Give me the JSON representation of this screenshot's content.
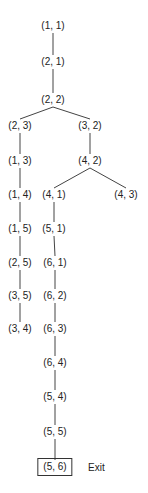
{
  "diagram": {
    "title": "",
    "nodes": [
      {
        "id": "n11",
        "label": "(1, 1)",
        "x": 53,
        "y": 26
      },
      {
        "id": "n21",
        "label": "(2, 1)",
        "x": 53,
        "y": 62
      },
      {
        "id": "n22",
        "label": "(2, 2)",
        "x": 53,
        "y": 100
      },
      {
        "id": "n23",
        "label": "(2, 3)",
        "x": 20,
        "y": 126
      },
      {
        "id": "n32",
        "label": "(3, 2)",
        "x": 90,
        "y": 126
      },
      {
        "id": "n13",
        "label": "(1, 3)",
        "x": 20,
        "y": 161
      },
      {
        "id": "n42",
        "label": "(4, 2)",
        "x": 90,
        "y": 161
      },
      {
        "id": "n14",
        "label": "(1, 4)",
        "x": 20,
        "y": 195
      },
      {
        "id": "n41",
        "label": "(4, 1)",
        "x": 54,
        "y": 195
      },
      {
        "id": "n43",
        "label": "(4, 3)",
        "x": 126,
        "y": 195
      },
      {
        "id": "n15",
        "label": "(1, 5)",
        "x": 20,
        "y": 229
      },
      {
        "id": "n51",
        "label": "(5, 1)",
        "x": 54,
        "y": 229
      },
      {
        "id": "n25",
        "label": "(2, 5)",
        "x": 20,
        "y": 263
      },
      {
        "id": "n61",
        "label": "(6, 1)",
        "x": 55,
        "y": 263
      },
      {
        "id": "n35",
        "label": "(3, 5)",
        "x": 20,
        "y": 296
      },
      {
        "id": "n62",
        "label": "(6, 2)",
        "x": 55,
        "y": 296
      },
      {
        "id": "n34",
        "label": "(3, 4)",
        "x": 20,
        "y": 329
      },
      {
        "id": "n63",
        "label": "(6, 3)",
        "x": 55,
        "y": 329
      },
      {
        "id": "n64",
        "label": "(6, 4)",
        "x": 55,
        "y": 363
      },
      {
        "id": "n54",
        "label": "(5, 4)",
        "x": 55,
        "y": 397
      },
      {
        "id": "n55",
        "label": "(5, 5)",
        "x": 55,
        "y": 432
      },
      {
        "id": "n56",
        "label": "(5, 6)",
        "x": 55,
        "y": 467,
        "boxed": true
      }
    ],
    "edges": [
      [
        "n11",
        "n21"
      ],
      [
        "n21",
        "n22"
      ],
      [
        "n22",
        "n23"
      ],
      [
        "n22",
        "n32"
      ],
      [
        "n23",
        "n13"
      ],
      [
        "n13",
        "n14"
      ],
      [
        "n14",
        "n15"
      ],
      [
        "n15",
        "n25"
      ],
      [
        "n25",
        "n35"
      ],
      [
        "n35",
        "n34"
      ],
      [
        "n32",
        "n42"
      ],
      [
        "n42",
        "n41"
      ],
      [
        "n42",
        "n43"
      ],
      [
        "n41",
        "n51"
      ],
      [
        "n51",
        "n61"
      ],
      [
        "n61",
        "n62"
      ],
      [
        "n62",
        "n63"
      ],
      [
        "n63",
        "n64"
      ],
      [
        "n64",
        "n54"
      ],
      [
        "n54",
        "n55"
      ],
      [
        "n55",
        "n56"
      ]
    ],
    "exit_label": "Exit",
    "exit_position": {
      "x": 88,
      "y": 467
    },
    "line_color": "#444444",
    "text_color": "#222222"
  }
}
